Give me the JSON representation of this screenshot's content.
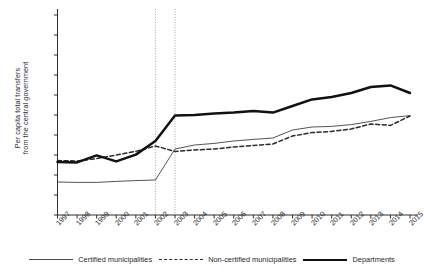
{
  "chart_data": {
    "type": "line",
    "title": "",
    "xlabel": "",
    "ylabel": "Per capita total transfers from the central government",
    "ylabel_line1": "Per capita total transfers",
    "ylabel_line2": "from the central government",
    "x": [
      1997,
      1998,
      1999,
      2000,
      2001,
      2002,
      2003,
      2004,
      2005,
      2006,
      2007,
      2008,
      2009,
      2010,
      2011,
      2012,
      2013,
      2014,
      2015
    ],
    "xtick_labels": [
      "1997",
      "1998",
      "1999",
      "2000",
      "2001",
      "2002",
      "2003",
      "2004",
      "2005",
      "2006",
      "2007",
      "2008",
      "2009",
      "2010",
      "2011",
      "2012",
      "2013",
      "2014",
      "2015"
    ],
    "ytick_labels": [
      "0",
      "100",
      "200",
      "300",
      "400",
      "500",
      "600",
      "700",
      "800",
      "900",
      "1,000"
    ],
    "ytick_values": [
      0,
      100,
      200,
      300,
      400,
      500,
      600,
      700,
      800,
      900,
      1000
    ],
    "ylim": [
      0,
      1000
    ],
    "xlim": [
      1997,
      2015
    ],
    "grid": false,
    "legend_position": "bottom",
    "annotations": [
      {
        "type": "vline",
        "x": 2002,
        "style": "dotted"
      },
      {
        "type": "vline",
        "x": 2003,
        "style": "dotted"
      }
    ],
    "series": [
      {
        "name": "Certified municipalities",
        "style": "thin-solid",
        "color": "#4a4a4a",
        "values": [
          165,
          163,
          163,
          168,
          172,
          175,
          330,
          350,
          358,
          370,
          378,
          385,
          425,
          440,
          443,
          452,
          468,
          487,
          497
        ]
      },
      {
        "name": "Non-certified municipalities",
        "style": "dashed",
        "color": "#2a2a2a",
        "values": [
          272,
          270,
          282,
          300,
          318,
          345,
          318,
          325,
          330,
          340,
          348,
          355,
          395,
          412,
          418,
          430,
          455,
          448,
          495
        ]
      },
      {
        "name": "Departments",
        "style": "thick-solid",
        "color": "#111111",
        "values": [
          265,
          263,
          298,
          268,
          302,
          370,
          497,
          500,
          508,
          512,
          520,
          512,
          545,
          578,
          590,
          610,
          640,
          648,
          610
        ]
      }
    ]
  },
  "legend": {
    "items": [
      {
        "label": "Certified municipalities",
        "swatch": "thin-solid"
      },
      {
        "label": "Non-certified municipalities",
        "swatch": "dashed"
      },
      {
        "label": "Departments",
        "swatch": "thick-solid"
      }
    ]
  }
}
